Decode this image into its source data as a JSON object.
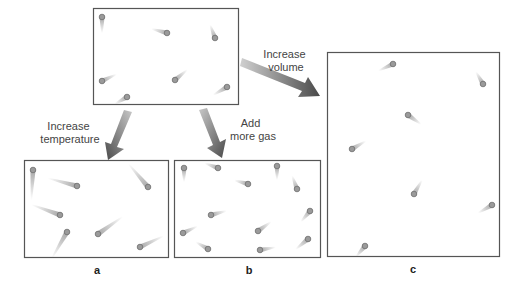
{
  "diagram": {
    "initial_container": {
      "label": "",
      "molecule_count": 7
    },
    "arrows": [
      {
        "id": "to-a",
        "label_lines": [
          "Increase",
          "temperature"
        ],
        "target": "a"
      },
      {
        "id": "to-b",
        "label_lines": [
          "Add",
          "more gas"
        ],
        "target": "b"
      },
      {
        "id": "to-c",
        "label_lines": [
          "Increase",
          "volume"
        ],
        "target": "c"
      }
    ],
    "panels": [
      {
        "id": "a",
        "label": "a",
        "molecule_count": 7,
        "speed": "fast"
      },
      {
        "id": "b",
        "label": "b",
        "molecule_count": 12,
        "speed": "normal"
      },
      {
        "id": "c",
        "label": "c",
        "molecule_count": 7,
        "speed": "normal"
      }
    ],
    "colors": {
      "box_stroke": "#555555",
      "arrow_dark": "#555555",
      "arrow_light": "#bdbdbd",
      "molecule_fill": "#9a9a9a",
      "text": "#444444"
    }
  }
}
